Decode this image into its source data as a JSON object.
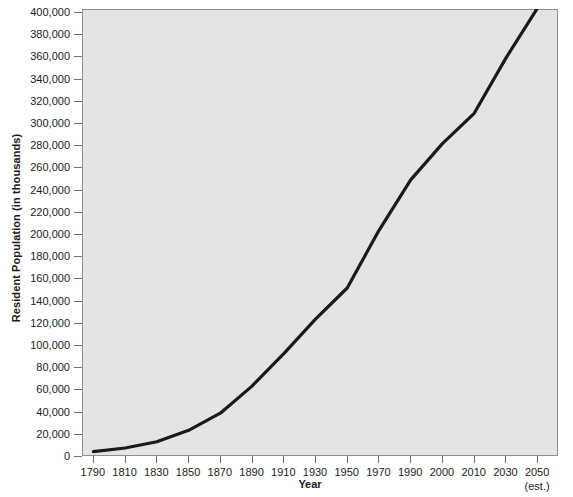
{
  "chart_data": {
    "type": "line",
    "title": "",
    "xlabel": "Year",
    "ylabel": "Resident Population (in thousands)",
    "xlabel_note": "(est.)",
    "grid": false,
    "legend": "none",
    "line_color": "#1a1a1a",
    "plot_bg_color": "#e4e4e4",
    "page_bg_color": "#ffffff",
    "ylim": [
      0,
      400000
    ],
    "ytick_labels": [
      "400,000",
      "380,000",
      "360,000",
      "340,000",
      "320,000",
      "300,000",
      "280,000",
      "260,000",
      "240,000",
      "220,000",
      "200,000",
      "180,000",
      "160,000",
      "140,000",
      "120,000",
      "100,000",
      "80,000",
      "60,000",
      "40,000",
      "20,000",
      "0"
    ],
    "ytick_values": [
      400000,
      380000,
      360000,
      340000,
      320000,
      300000,
      280000,
      260000,
      240000,
      220000,
      200000,
      180000,
      160000,
      140000,
      120000,
      100000,
      80000,
      60000,
      40000,
      20000,
      0
    ],
    "xtick_labels": [
      "1790",
      "1810",
      "1830",
      "1850",
      "1870",
      "1890",
      "1910",
      "1930",
      "1950",
      "1970",
      "1990",
      "2000",
      "2010",
      "2030",
      "2050"
    ],
    "categories": [
      "1790",
      "1810",
      "1830",
      "1850",
      "1870",
      "1890",
      "1910",
      "1930",
      "1950",
      "1970",
      "1990",
      "2000",
      "2010",
      "2030",
      "2050"
    ],
    "values": [
      3929,
      7240,
      12866,
      23192,
      38558,
      62980,
      92228,
      123203,
      151326,
      203302,
      248710,
      281422,
      308746,
      358471,
      403687
    ],
    "series": [
      {
        "name": "Resident Population",
        "values": [
          3929,
          7240,
          12866,
          23192,
          38558,
          62980,
          92228,
          123203,
          151326,
          203302,
          248710,
          281422,
          308746,
          358471,
          403687
        ]
      }
    ]
  }
}
